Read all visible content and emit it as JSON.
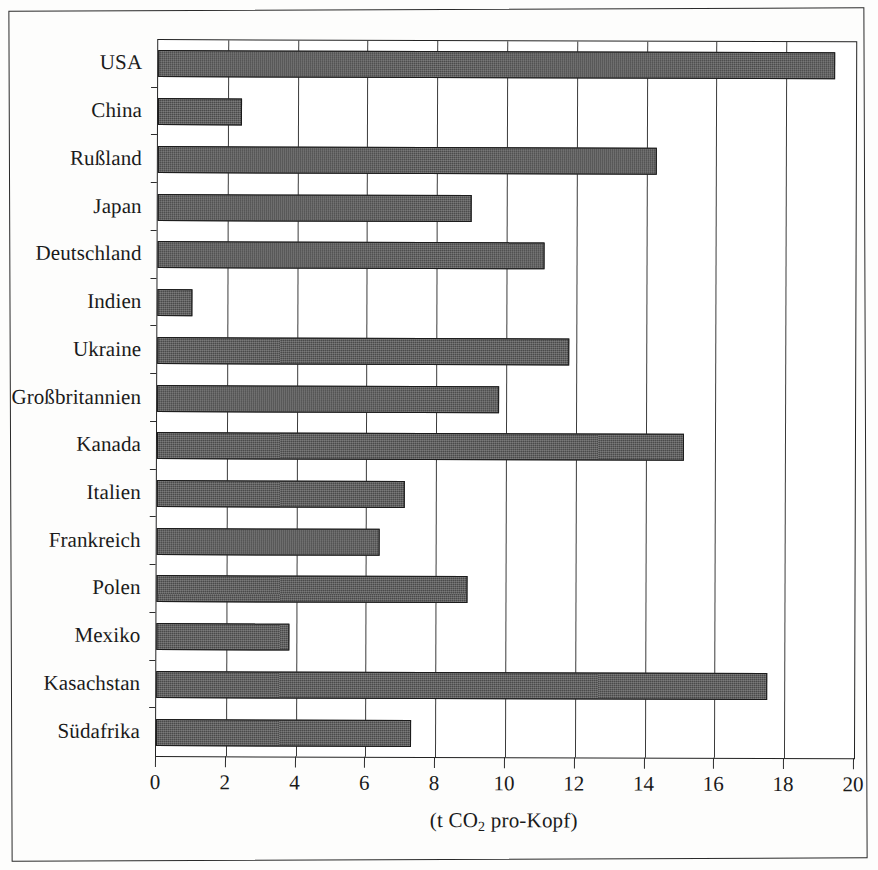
{
  "figure": {
    "frame": "scanned-page-border",
    "bar_color": "#4a4a4a",
    "bar_edge_color": "#1b1b1b",
    "grid_color": "#3b3b3b",
    "axis_color": "#232323"
  },
  "chart_data": {
    "type": "bar",
    "orientation": "horizontal",
    "title": "",
    "subtitle": "",
    "xlabel_parts": {
      "prefix": "(t CO",
      "subscript": "2",
      "suffix": " pro-Kopf)"
    },
    "xlabel": "(t CO2 pro-Kopf)",
    "ylabel": "",
    "xlim": [
      0,
      20
    ],
    "xticks": [
      0,
      2,
      4,
      6,
      8,
      10,
      12,
      14,
      16,
      18,
      20
    ],
    "xticklabels": [
      "0",
      "2",
      "4",
      "6",
      "8",
      "10",
      "12",
      "14",
      "16",
      "18",
      "20"
    ],
    "grid": "vertical-only",
    "legend": "none",
    "categories": [
      "USA",
      "China",
      "Rußland",
      "Japan",
      "Deutschland",
      "Indien",
      "Ukraine",
      "Großbritannien",
      "Kanada",
      "Italien",
      "Frankreich",
      "Polen",
      "Mexiko",
      "Kasachstan",
      "Südafrika"
    ],
    "values": [
      19.4,
      2.4,
      14.3,
      9.0,
      11.1,
      1.0,
      11.8,
      9.8,
      15.1,
      7.1,
      6.4,
      8.9,
      3.8,
      17.5,
      7.3
    ],
    "series": [
      {
        "name": "CO2-Emissionen pro Kopf",
        "values": [
          19.4,
          2.4,
          14.3,
          9.0,
          11.1,
          1.0,
          11.8,
          9.8,
          15.1,
          7.1,
          6.4,
          8.9,
          3.8,
          17.5,
          7.3
        ]
      }
    ]
  }
}
